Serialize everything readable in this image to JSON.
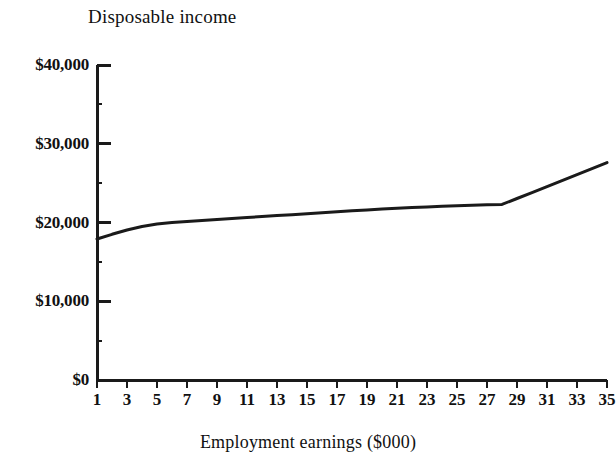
{
  "chart_data": {
    "type": "line",
    "title": "Disposable income",
    "xlabel": "Employment earnings ($000)",
    "ylabel": "",
    "xlim": [
      1,
      35
    ],
    "ylim": [
      0,
      40000
    ],
    "grid": false,
    "legend": null,
    "y_tick_labels": [
      "$40,000",
      "$30,000",
      "$20,000",
      "$10,000",
      "$0"
    ],
    "y_ticks": [
      40000,
      30000,
      20000,
      10000,
      0
    ],
    "y_minor_ticks": [
      35000,
      25000,
      15000,
      5000
    ],
    "x_tick_labels": [
      "1",
      "3",
      "5",
      "7",
      "9",
      "11",
      "13",
      "15",
      "17",
      "19",
      "21",
      "23",
      "25",
      "27",
      "29",
      "31",
      "33",
      "35"
    ],
    "x_ticks": [
      1,
      3,
      5,
      7,
      9,
      11,
      13,
      15,
      17,
      19,
      21,
      23,
      25,
      27,
      29,
      31,
      33,
      35
    ],
    "series": [
      {
        "name": "Disposable income",
        "color": "#1a1a1a",
        "x": [
          1,
          2,
          3,
          4,
          5,
          6,
          7,
          8,
          9,
          10,
          11,
          12,
          13,
          14,
          15,
          16,
          17,
          18,
          19,
          20,
          21,
          22,
          23,
          24,
          25,
          26,
          27,
          28,
          29,
          30,
          31,
          32,
          33,
          34,
          35
        ],
        "values": [
          17900,
          18500,
          19050,
          19500,
          19800,
          20000,
          20120,
          20240,
          20370,
          20500,
          20630,
          20760,
          20880,
          21000,
          21120,
          21240,
          21360,
          21480,
          21590,
          21700,
          21800,
          21890,
          21980,
          22060,
          22130,
          22190,
          22250,
          22300,
          23050,
          23800,
          24560,
          25320,
          26080,
          26840,
          27600
        ]
      }
    ]
  }
}
